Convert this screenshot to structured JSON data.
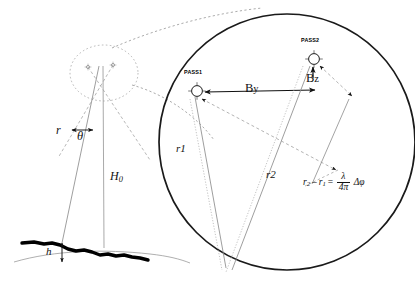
{
  "figure": {
    "type": "insar-geometry-diagram",
    "background_color": "#ffffff",
    "line_color": "#1a1a1a",
    "terrain_color": "#000000"
  },
  "left_geometry": {
    "slant_range_label": "r",
    "look_angle_label": "θ",
    "platform_height_label": "H",
    "platform_height_subscript": "0",
    "terrain_height_label": "h"
  },
  "inset": {
    "pass1_label": "PASS1",
    "pass2_label": "PASS2",
    "baseline_horizontal_label": "By",
    "baseline_horizontal_symbol": "B",
    "baseline_horizontal_subscript": "y",
    "baseline_vertical_label": "Bz",
    "baseline_vertical_symbol": "B",
    "baseline_vertical_subscript": "z",
    "range1_label": "r1",
    "range2_label": "r2"
  },
  "equation": {
    "lhs_r2": "r",
    "lhs_r2_sub": "2",
    "minus": "–",
    "lhs_r1": "r",
    "lhs_r1_sub": "1",
    "equals": "=",
    "numerator": "λ",
    "denominator": "4π",
    "phase_term": "Δφ",
    "full_text": "r₂ – r₁ = (λ / 4π) Δφ"
  }
}
